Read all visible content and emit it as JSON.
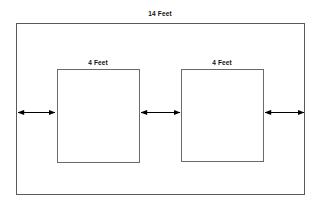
{
  "diagram": {
    "background_color": "#ffffff",
    "stroke_color": "#555555",
    "arrow_color": "#000000",
    "text_color": "#111111",
    "labels": {
      "outer_width": "14 Feet",
      "box_left_width": "4 Feet",
      "box_right_width": "4 Feet"
    },
    "shapes": {
      "outer_rect": {
        "name": "outer-room-rectangle",
        "x": 16,
        "y": 23,
        "width": 289,
        "height": 172
      },
      "box_left": {
        "name": "left-inner-square",
        "x": 57,
        "y": 69,
        "width": 83,
        "height": 94
      },
      "box_right": {
        "name": "right-inner-square",
        "x": 181,
        "y": 69,
        "width": 83,
        "height": 93
      }
    },
    "arrows": [
      {
        "name": "gap-arrow-left",
        "x1": 17,
        "x2": 56,
        "y": 112,
        "double_headed": true
      },
      {
        "name": "gap-arrow-middle",
        "x1": 140,
        "x2": 181,
        "y": 112,
        "double_headed": true
      },
      {
        "name": "gap-arrow-right",
        "x1": 264,
        "x2": 305,
        "y": 112,
        "double_headed": true
      }
    ]
  }
}
